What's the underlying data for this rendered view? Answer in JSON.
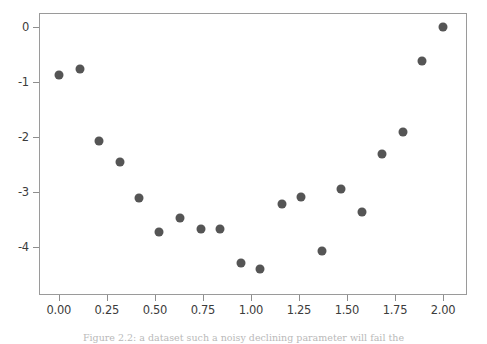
{
  "figure": {
    "caption": "Figure 2.2: a dataset such a noisy declining parameter will fail the",
    "marker_color": "#555555",
    "axes_color": "#9a9a9a",
    "background": "#ffffff"
  },
  "chart_data": {
    "type": "scatter",
    "title": "",
    "xlabel": "",
    "ylabel": "",
    "xlim": [
      -0.103,
      2.125
    ],
    "ylim": [
      -4.87,
      0.26
    ],
    "grid": false,
    "legend": null,
    "xticks": [
      "0.00",
      "0.25",
      "0.50",
      "0.75",
      "1.00",
      "1.25",
      "1.50",
      "1.75",
      "2.00"
    ],
    "xtick_values": [
      0.0,
      0.25,
      0.5,
      0.75,
      1.0,
      1.25,
      1.5,
      1.75,
      2.0
    ],
    "yticks": [
      "0",
      "-1",
      "-2",
      "-3",
      "-4"
    ],
    "ytick_values": [
      0,
      -1,
      -2,
      -3,
      -4
    ],
    "series": [
      {
        "name": "data",
        "marker": "circle",
        "color": "#555555",
        "x": [
          0.0,
          0.11,
          0.21,
          0.32,
          0.42,
          0.52,
          0.63,
          0.74,
          0.84,
          0.95,
          1.05,
          1.16,
          1.26,
          1.37,
          1.47,
          1.58,
          1.68,
          1.79,
          1.89,
          2.0
        ],
        "y": [
          -0.87,
          -0.76,
          -2.06,
          -2.45,
          -3.1,
          -3.72,
          -3.47,
          -3.67,
          -3.67,
          -4.28,
          -4.4,
          -3.22,
          -3.08,
          -4.07,
          -2.95,
          -3.36,
          -2.31,
          -1.9,
          -0.62,
          0.0
        ]
      }
    ]
  }
}
